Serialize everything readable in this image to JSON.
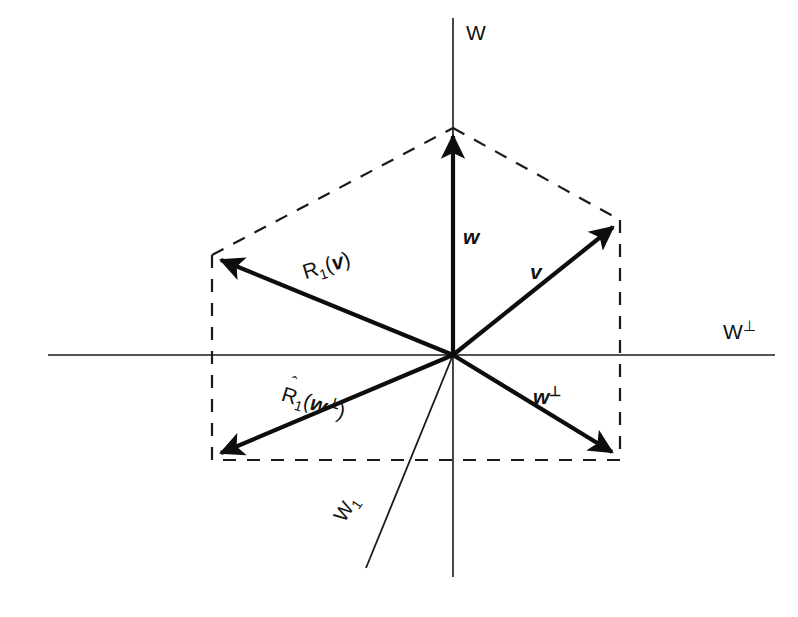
{
  "figure": {
    "background_color": "#ffffff",
    "ink_color": "#111111"
  },
  "axes": {
    "vertical": {
      "label": "W",
      "x": 453,
      "y_top": 18,
      "y_bottom": 577
    },
    "horizontal": {
      "label_main": "W",
      "label_super": "⊥",
      "y": 355,
      "x_left": 48,
      "x_right": 775
    }
  },
  "origin": {
    "x": 453,
    "y": 355
  },
  "subspace_line": {
    "name": "W1",
    "label_main": "W",
    "label_sub": "1",
    "x1": 453,
    "y1": 355,
    "x2": 366,
    "y2": 568
  },
  "vectors": [
    {
      "id": "w",
      "label_main": "w",
      "label_super": "",
      "tip_x": 453,
      "tip_y": 128,
      "description": "vertical vector w along W axis"
    },
    {
      "id": "v",
      "label_main": "v",
      "label_super": "",
      "tip_x": 620,
      "tip_y": 220,
      "description": "vector v to upper right"
    },
    {
      "id": "R1v",
      "label_main": "R",
      "label_sub": "1",
      "label_arg": "v",
      "label_super": "",
      "has_hat": false,
      "tip_x": 212,
      "tip_y": 255,
      "description": "reflected vector R1(v) to upper left"
    },
    {
      "id": "wperp",
      "label_main": "w",
      "label_super": "⊥",
      "tip_x": 620,
      "tip_y": 460,
      "description": "vector w-perp to lower right"
    },
    {
      "id": "R1wperp",
      "label_main": "R",
      "label_sub": "1",
      "label_arg": "w",
      "label_super": "⊥",
      "has_hat": true,
      "hat_glyph": "ˆ",
      "tip_x": 212,
      "tip_y": 460,
      "description": "reflected vector R-hat-1(w-perp) to lower left"
    }
  ],
  "dashed_outline": {
    "style": "dashed",
    "points": [
      {
        "x": 212,
        "y": 255
      },
      {
        "x": 453,
        "y": 128
      },
      {
        "x": 620,
        "y": 220
      },
      {
        "x": 620,
        "y": 460
      },
      {
        "x": 212,
        "y": 460
      }
    ],
    "closed": true
  }
}
